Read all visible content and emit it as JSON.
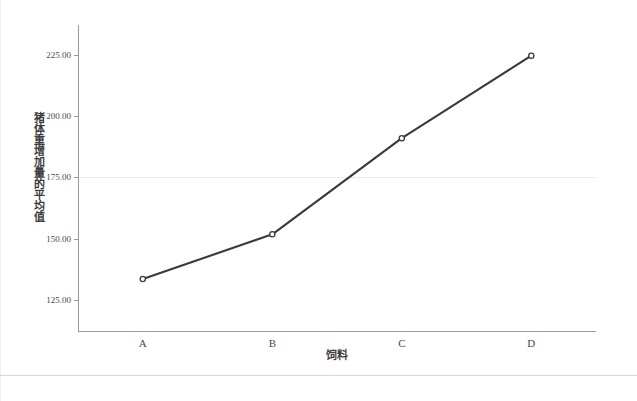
{
  "chart_data": {
    "type": "line",
    "title": "",
    "subtitle": "",
    "xlabel": "饲料",
    "ylabel": "猪体重增加量的平均值",
    "categories": [
      "A",
      "B",
      "C",
      "D"
    ],
    "series": [
      {
        "name": "猪体重增加量的平均值",
        "values": [
          133.6,
          151.8,
          190.9,
          224.5
        ],
        "color": "#3a3a3a",
        "marker": "circle"
      }
    ],
    "y_ticks": [
      "125.00",
      "150.00",
      "175.00",
      "200.00",
      "225.00"
    ],
    "y_tick_values": [
      125,
      150,
      175,
      200,
      225
    ],
    "ylim": [
      112,
      237
    ],
    "x_tick_labels": [
      "A",
      "B",
      "C",
      "D"
    ],
    "grid": true,
    "gridlines_y": [
      175
    ],
    "legend": "none",
    "legend_position": "none"
  },
  "figure": {
    "background_color": "#ffffff",
    "axis_color": "#9a9a9a",
    "grid_color": "#e9ecef",
    "line_color": "#3a3a3a",
    "marker_fill_color": "#ffffff",
    "marker_edge_color": "#3a3a3a",
    "text_color": "#4a4a4a"
  }
}
